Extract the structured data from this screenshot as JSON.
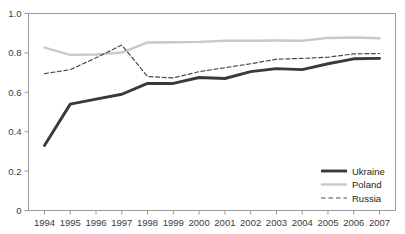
{
  "chart_data": {
    "type": "line",
    "title": "",
    "xlabel": "",
    "ylabel": "",
    "x": [
      1994,
      1995,
      1996,
      1997,
      1998,
      1999,
      2000,
      2001,
      2002,
      2003,
      2004,
      2005,
      2006,
      2007
    ],
    "categories": [
      "1994",
      "1995",
      "1996",
      "1997",
      "1998",
      "1999",
      "2000",
      "2001",
      "2002",
      "2003",
      "2004",
      "2005",
      "2006",
      "2007"
    ],
    "ylim": [
      0,
      1.0
    ],
    "y_ticks": [
      0,
      0.2,
      0.4,
      0.6,
      0.8,
      1.0
    ],
    "y_tick_labels": [
      "0",
      "0.2",
      "0.4",
      "0.6",
      "0.8",
      "1.0"
    ],
    "grid": false,
    "legend_position": "bottom-right",
    "series": [
      {
        "name": "Ukraine",
        "style": "solid-thick",
        "color": "#3a3a3a",
        "values": [
          0.33,
          0.54,
          0.565,
          0.59,
          0.645,
          0.645,
          0.675,
          0.67,
          0.705,
          0.72,
          0.715,
          0.745,
          0.77,
          0.772
        ]
      },
      {
        "name": "Poland",
        "style": "solid-light",
        "color": "#c9c9c9",
        "values": [
          0.827,
          0.79,
          0.792,
          0.802,
          0.853,
          0.854,
          0.856,
          0.862,
          0.862,
          0.863,
          0.862,
          0.876,
          0.878,
          0.874
        ]
      },
      {
        "name": "Russia",
        "style": "dashed",
        "color": "#4a4a4a",
        "values": [
          0.695,
          0.715,
          0.775,
          0.84,
          0.68,
          0.673,
          0.705,
          0.725,
          0.745,
          0.768,
          0.772,
          0.778,
          0.795,
          0.797
        ]
      }
    ]
  },
  "legend": {
    "items": [
      {
        "label": "Ukraine"
      },
      {
        "label": "Poland"
      },
      {
        "label": "Russia"
      }
    ]
  },
  "colors": {
    "ukraine": "#3a3a3a",
    "poland": "#c9c9c9",
    "russia": "#4a4a4a",
    "axis": "#9a9a9a",
    "text": "#231f20",
    "background": "#ffffff"
  }
}
